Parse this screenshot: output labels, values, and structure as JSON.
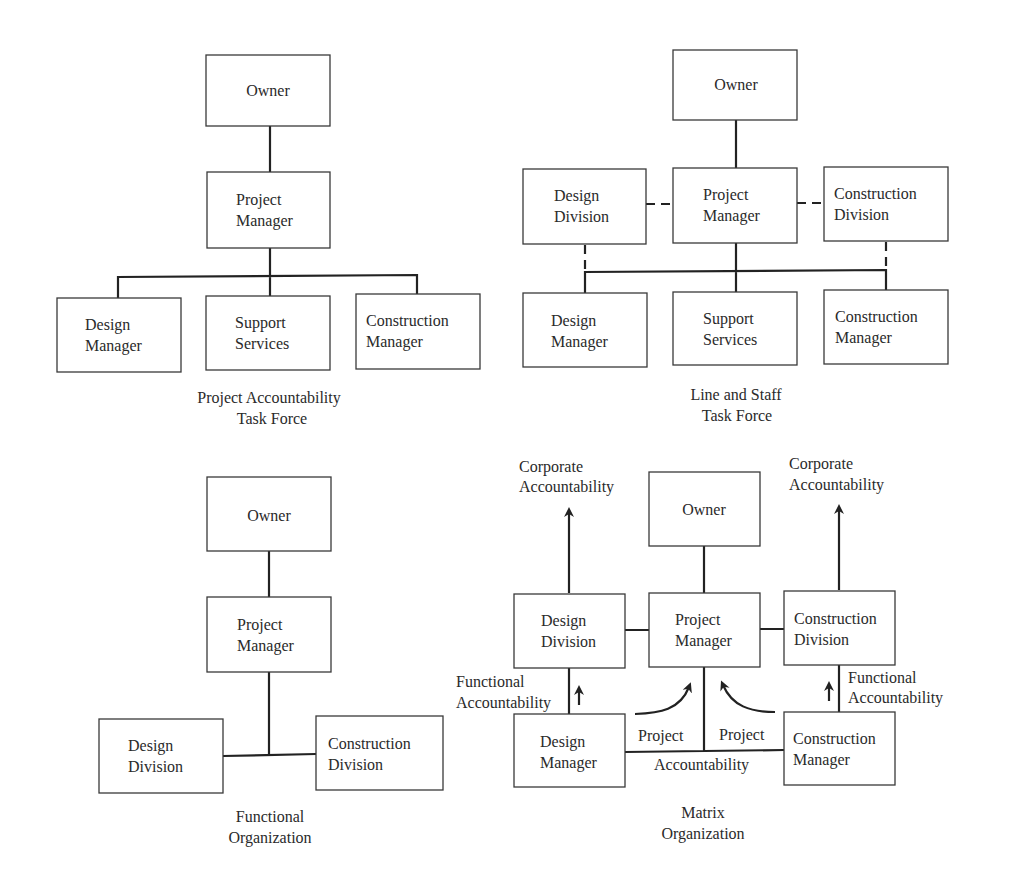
{
  "diagrams": {
    "project_accountability": {
      "caption": [
        "Project Accountability",
        "Task Force"
      ],
      "boxes": {
        "owner": [
          "Owner"
        ],
        "pm": [
          "Project",
          "Manager"
        ],
        "dm": [
          "Design",
          "Manager"
        ],
        "ss": [
          "Support",
          "Services"
        ],
        "cm": [
          "Construction",
          "Manager"
        ]
      }
    },
    "line_staff": {
      "caption": [
        "Line and Staff",
        "Task Force"
      ],
      "boxes": {
        "owner": [
          "Owner"
        ],
        "dd": [
          "Design",
          "Division"
        ],
        "pm": [
          "Project",
          "Manager"
        ],
        "cd": [
          "Construction",
          "Division"
        ],
        "dm": [
          "Design",
          "Manager"
        ],
        "ss": [
          "Support",
          "Services"
        ],
        "cm": [
          "Construction",
          "Manager"
        ]
      }
    },
    "functional": {
      "caption": [
        "Functional",
        "Organization"
      ],
      "boxes": {
        "owner": [
          "Owner"
        ],
        "pm": [
          "Project",
          "Manager"
        ],
        "dd": [
          "Design",
          "Division"
        ],
        "cd": [
          "Construction",
          "Division"
        ]
      }
    },
    "matrix": {
      "caption": [
        "Matrix",
        "Organization"
      ],
      "boxes": {
        "owner": [
          "Owner"
        ],
        "dd": [
          "Design",
          "Division"
        ],
        "pm": [
          "Project",
          "Manager"
        ],
        "cd": [
          "Construction",
          "Division"
        ],
        "dm": [
          "Design",
          "Manager"
        ],
        "cm": [
          "Construction",
          "Manager"
        ]
      },
      "labels": {
        "corp_left": [
          "Corporate",
          "Accountability"
        ],
        "corp_right": [
          "Corporate",
          "Accountability"
        ],
        "func_left": [
          "Functional",
          "Accountability"
        ],
        "func_right": [
          "Functional",
          "Accountability"
        ],
        "project_left": "Project",
        "project_right": "Project",
        "accountability": "Accountability"
      }
    }
  }
}
